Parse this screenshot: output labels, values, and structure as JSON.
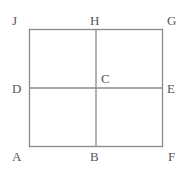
{
  "diagram": {
    "type": "square grid divided into four quadrants",
    "line_color": "#8a8a8a",
    "labels": {
      "J": "J",
      "H": "H",
      "G": "G",
      "D": "D",
      "C": "C",
      "E": "E",
      "A": "A",
      "B": "B",
      "F": "F"
    }
  }
}
